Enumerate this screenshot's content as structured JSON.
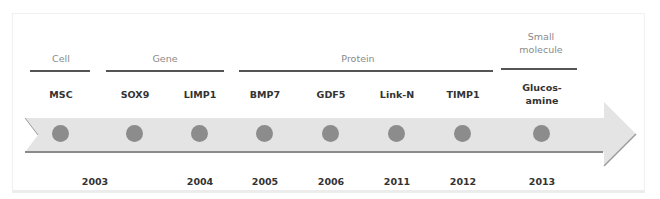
{
  "categories": [
    {
      "label": "Cell",
      "x": 31,
      "line_x": 30,
      "line_w": 60
    },
    {
      "label": "Gene",
      "x": 152,
      "line_x": 106,
      "line_w": 118
    },
    {
      "label": "Protein",
      "x": 336,
      "line_x": 239,
      "line_w": 254
    },
    {
      "label": "Small molecule",
      "label_line1": "Small",
      "label_line2": "molecule",
      "x": 540,
      "line_x": 501,
      "line_w": 76
    }
  ],
  "items": [
    {
      "label": "MSC",
      "year": "2003",
      "x": 61
    },
    {
      "label": "SOX9",
      "year": "",
      "x": 135
    },
    {
      "label": "LIMP1",
      "year": "2004",
      "x": 200
    },
    {
      "label": "BMP7",
      "year": "2005",
      "x": 265
    },
    {
      "label": "GDF5",
      "year": "2006",
      "x": 331
    },
    {
      "label": "Link-N",
      "year": "2011",
      "x": 397
    },
    {
      "label": "TIMP1",
      "year": "2012",
      "x": 463
    },
    {
      "label": "Glucos-amine",
      "label_line1": "Glucos-",
      "label_line2": "amine",
      "year": "2013",
      "x": 542
    }
  ],
  "year_positions": {
    "2003": 95
  },
  "colors": {
    "arrow_fill": "#e4e4e4",
    "arrow_shadow": "#8a8a8a",
    "dot": "#8c8c8c",
    "category_text": "#8a8a8a",
    "item_text": "#333333",
    "category_line": "#555555"
  }
}
